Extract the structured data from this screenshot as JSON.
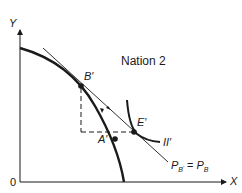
{
  "title": "Nation 2",
  "axes": {
    "y_label": "Y",
    "x_label": "X",
    "origin_label": "0"
  },
  "points": {
    "b_prime": "B′",
    "e_prime": "E′",
    "a_prime": "A′"
  },
  "curves": {
    "indifference_curve": "II′",
    "price_line_label": {
      "p1": "P",
      "p1_sub": "B",
      "p1_subsub": "′",
      "eq": "=",
      "p2": "P",
      "p2_sub": "B"
    }
  },
  "colors": {
    "ink": "#1a1a1a",
    "background": "#ffffff"
  }
}
